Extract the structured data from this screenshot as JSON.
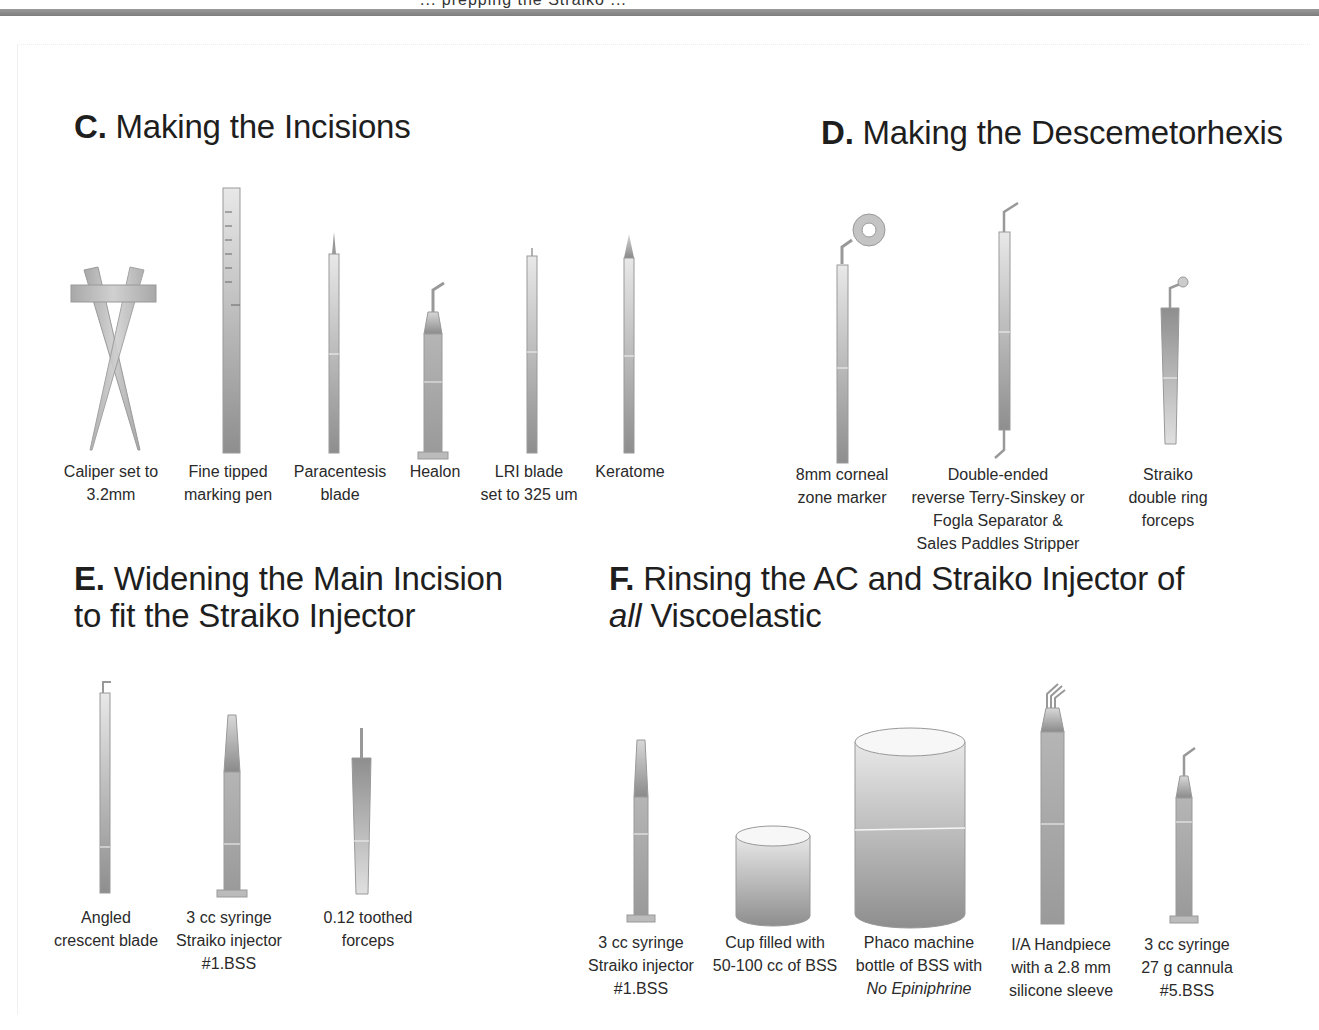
{
  "header": {
    "cut_title_text": "... prepping the Straiko ... ",
    "bar_color": "#888888"
  },
  "colors": {
    "instrument_light": "#e4e4e4",
    "instrument_mid": "#b8b8b8",
    "instrument_dark": "#8f8f8f",
    "outline": "#9a9a9a",
    "text": "#222222"
  },
  "sections": {
    "C": {
      "letter": "C.",
      "title": "Making the Incisions",
      "items": [
        {
          "line1": "Caliper set to",
          "line2": "3.2mm",
          "icon": "caliper-icon"
        },
        {
          "line1": "Fine tipped",
          "line2": "marking pen",
          "icon": "marking-pen-icon"
        },
        {
          "line1": "Paracentesis",
          "line2": "blade",
          "icon": "paracentesis-blade-icon"
        },
        {
          "line1": "Healon",
          "line2": "",
          "icon": "healon-syringe-icon"
        },
        {
          "line1": "LRI blade",
          "line2": "set to 325 um",
          "icon": "lri-blade-icon"
        },
        {
          "line1": "Keratome",
          "line2": "",
          "icon": "keratome-icon"
        }
      ]
    },
    "D": {
      "letter": "D.",
      "title": "Making the Descemetorhexis",
      "items": [
        {
          "line1": "8mm corneal",
          "line2": "zone marker",
          "line3": "",
          "line4": "",
          "icon": "zone-marker-icon"
        },
        {
          "line1": "Double-ended",
          "line2": "reverse Terry-Sinskey or",
          "line3": "Fogla Separator &",
          "line4": "Sales Paddles Stripper",
          "icon": "double-ended-separator-icon"
        },
        {
          "line1": "Straiko",
          "line2": "double ring",
          "line3": "forceps",
          "line4": "",
          "icon": "double-ring-forceps-icon"
        }
      ]
    },
    "E": {
      "letter": "E.",
      "title_line1": "Widening the Main Incision",
      "title_line2": "to fit the Straiko Injector",
      "items": [
        {
          "line1": "Angled",
          "line2": "crescent blade",
          "line3": "",
          "icon": "crescent-blade-icon"
        },
        {
          "line1": "3 cc syringe",
          "line2": "Straiko injector",
          "line3": "#1.BSS",
          "icon": "straiko-injector-syringe-icon"
        },
        {
          "line1": "0.12 toothed",
          "line2": "forceps",
          "line3": "",
          "icon": "toothed-forceps-icon"
        }
      ]
    },
    "F": {
      "letter": "F.",
      "title_line1": "Rinsing the AC and Straiko Injector of",
      "title_line2_italic": "all",
      "title_line2_rest": " Viscoelastic",
      "items": [
        {
          "line1": "3 cc syringe",
          "line2": "Straiko injector",
          "line3": "#1.BSS",
          "line3_italic": false,
          "icon": "straiko-injector-syringe-icon"
        },
        {
          "line1": "Cup filled with",
          "line2": "50-100 cc of BSS",
          "line3": "",
          "line3_italic": false,
          "icon": "bss-cup-icon"
        },
        {
          "line1": "Phaco machine",
          "line2": "bottle of BSS with",
          "line3": "No Epiniphrine",
          "line3_italic": true,
          "icon": "bss-bottle-icon"
        },
        {
          "line1": "I/A Handpiece",
          "line2": "with a 2.8 mm",
          "line3": "silicone sleeve",
          "line3_italic": false,
          "icon": "ia-handpiece-icon"
        },
        {
          "line1": "3 cc syringe",
          "line2": "27 g cannula",
          "line3": "#5.BSS",
          "line3_italic": false,
          "icon": "cannula-syringe-icon"
        }
      ]
    }
  }
}
